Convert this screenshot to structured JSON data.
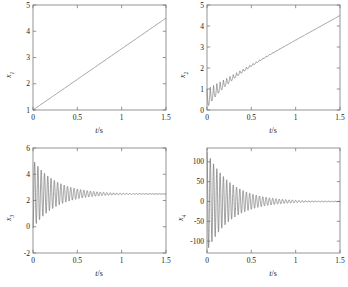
{
  "figure": {
    "background": "#ffffff",
    "line_color": "#6b6b6b",
    "axis_color": "#7a7a7a",
    "caption": ""
  },
  "chart_data": [
    {
      "type": "line",
      "name": "subplot-x1",
      "position": "top-left",
      "title": "",
      "xlabel": "t/s",
      "ylabel": "x1",
      "ylabel_base": "x",
      "ylabel_sub": "1",
      "xlim": [
        0,
        1.5
      ],
      "ylim": [
        1,
        5
      ],
      "xticks": [
        0,
        0.5,
        1,
        1.5
      ],
      "xticklabels": [
        "0",
        "0.5",
        "1",
        "1.5"
      ],
      "yticks": [
        1,
        2,
        3,
        4,
        5
      ],
      "yticklabels": [
        "1",
        "2",
        "3",
        "4",
        "5"
      ],
      "grid": false,
      "legend": "none",
      "series": [
        {
          "name": "x1",
          "description": "monotonic near-linear ramp from 1 at t=0 to about 4.5 at t=1.5",
          "x": [
            0,
            0.1,
            0.2,
            0.3,
            0.4,
            0.5,
            0.6,
            0.7,
            0.8,
            0.9,
            1.0,
            1.1,
            1.2,
            1.3,
            1.4,
            1.5
          ],
          "values": [
            1.0,
            1.23,
            1.47,
            1.7,
            1.93,
            2.17,
            2.4,
            2.63,
            2.87,
            3.1,
            3.33,
            3.57,
            3.8,
            4.03,
            4.27,
            4.5
          ]
        }
      ]
    },
    {
      "type": "line",
      "name": "subplot-x2",
      "position": "top-right",
      "title": "",
      "xlabel": "t/s",
      "ylabel": "x2",
      "ylabel_base": "x",
      "ylabel_sub": "2",
      "xlim": [
        0,
        1.5
      ],
      "ylim": [
        0,
        5
      ],
      "xticks": [
        0,
        0.5,
        1,
        1.5
      ],
      "xticklabels": [
        "0",
        "0.5",
        "1",
        "1.5"
      ],
      "yticks": [
        0,
        1,
        2,
        3,
        4,
        5
      ],
      "yticklabels": [
        "0",
        "1",
        "2",
        "3",
        "4",
        "5"
      ],
      "grid": false,
      "legend": "none",
      "series": [
        {
          "name": "x2",
          "description": "rising ramp from about 1 to 4.5 with a decaying sinusoidal ripple of initial amplitude about 0.9 damped out by t=0.7",
          "ramp_start": 1.0,
          "ramp_end": 4.5,
          "osc_amplitude": 0.9,
          "osc_decay_time": 0.22,
          "osc_frequency_hz": 27
        }
      ]
    },
    {
      "type": "line",
      "name": "subplot-x3",
      "position": "bottom-left",
      "title": "",
      "xlabel": "t/s",
      "ylabel": "x3",
      "ylabel_base": "x",
      "ylabel_sub": "3",
      "xlim": [
        0,
        1.5
      ],
      "ylim": [
        -2,
        6
      ],
      "xticks": [
        0,
        0.5,
        1,
        1.5
      ],
      "xticklabels": [
        "0",
        "0.5",
        "1",
        "1.5"
      ],
      "yticks": [
        -2,
        0,
        2,
        4,
        6
      ],
      "yticklabels": [
        "-2",
        "0",
        "2",
        "4",
        "6"
      ],
      "grid": false,
      "legend": "none",
      "series": [
        {
          "name": "x3",
          "description": "damped oscillation about a steady value of 2.5, initial swing from about -1.7 up to 5.0, settled flat after t=0.95",
          "steady_value": 2.5,
          "osc_amplitude": 2.6,
          "osc_decay_time": 0.26,
          "osc_frequency_hz": 27
        }
      ]
    },
    {
      "type": "line",
      "name": "subplot-x4",
      "position": "bottom-right",
      "title": "",
      "xlabel": "t/s",
      "ylabel": "x4",
      "ylabel_base": "x",
      "ylabel_sub": "4",
      "xlim": [
        0,
        1.5
      ],
      "ylim": [
        -130,
        135
      ],
      "xticks": [
        0,
        0.5,
        1,
        1.5
      ],
      "xticklabels": [
        "0",
        "0.5",
        "1",
        "1.5"
      ],
      "yticks": [
        -100,
        -50,
        0,
        50,
        100
      ],
      "yticklabels": [
        "-100",
        "-50",
        "0",
        "50",
        "100"
      ],
      "grid": false,
      "legend": "none",
      "series": [
        {
          "name": "x4",
          "description": "damped oscillation about zero, initial amplitude about 125 decaying to flat zero after t=1.15",
          "steady_value": 0,
          "osc_amplitude": 125,
          "osc_decay_time": 0.27,
          "osc_frequency_hz": 27
        }
      ]
    }
  ]
}
